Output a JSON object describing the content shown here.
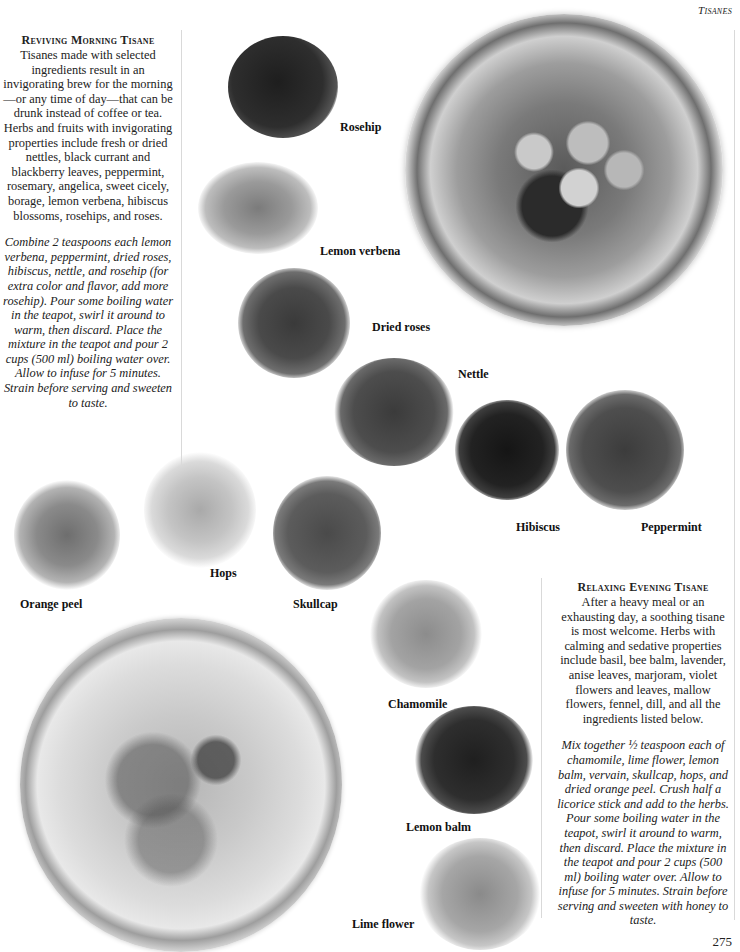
{
  "page": {
    "running_head": "Tisanes",
    "page_number": "275"
  },
  "morning": {
    "title": "Reviving Morning Tisane",
    "body": "Tisanes made with selected ingredients result in an invigorating brew for the morning—or any time of day—that can be drunk instead of coffee or tea. Herbs and fruits with invigorating properties include fresh or dried nettles, black currant and blackberry leaves, peppermint, rosemary, angelica, sweet cicely, borage, lemon verbena, hibiscus blossoms, rosehips, and roses.",
    "recipe": "Combine 2 teaspoons each lemon verbena, peppermint, dried roses, hibiscus, nettle, and rosehip (for extra color and flavor, add more rosehip). Pour some boiling water in the teapot, swirl it around to warm, then discard. Place the mixture in the teapot and pour 2 cups (500 ml) boiling water over. Allow to infuse for 5 minutes. Strain before serving and sweeten to taste."
  },
  "evening": {
    "title": "Relaxing Evening Tisane",
    "body": "After a heavy meal or an exhausting day, a soothing tisane is most welcome. Herbs with calming and sedative properties include basil, bee balm, lavender, anise leaves, marjoram, violet flowers and leaves, mallow flowers, fennel, dill, and all the ingredients listed below.",
    "recipe": "Mix together ½ teaspoon each of chamomile, lime flower, lemon balm, vervain, skullcap, hops, and dried orange peel. Crush half a licorice stick and add to the herbs. Pour some boiling water in the teapot, swirl it around to warm, then discard. Place the mixture in the teapot and pour 2 cups (500 ml) boiling water over. Allow to infuse for 5 minutes. Strain before serving and sweeten with honey to taste."
  },
  "labels": {
    "rosehip": "Rosehip",
    "lemon_verbena": "Lemon verbena",
    "dried_roses": "Dried roses",
    "nettle": "Nettle",
    "hibiscus": "Hibiscus",
    "peppermint": "Peppermint",
    "orange_peel": "Orange peel",
    "hops": "Hops",
    "skullcap": "Skullcap",
    "chamomile": "Chamomile",
    "lemon_balm": "Lemon balm",
    "lime_flower": "Lime flower"
  }
}
